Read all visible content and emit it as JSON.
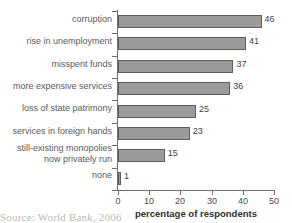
{
  "chart_data": {
    "type": "bar",
    "orientation": "horizontal",
    "title": "",
    "xlabel": "percentage of respondents",
    "ylabel": "",
    "xlim": [
      0,
      50
    ],
    "xticks": [
      0,
      10,
      20,
      30,
      40,
      50
    ],
    "grid": false,
    "legend": null,
    "categories": [
      "corruption",
      "rise in unemployment",
      "misspent funds",
      "more expensive services",
      "loss of state patrimony",
      "services in foreign hands",
      "still-existing monopolies\nnow privately run",
      "none"
    ],
    "values": [
      46,
      41,
      37,
      36,
      25,
      23,
      15,
      1
    ],
    "value_labels": [
      "46",
      "41",
      "37",
      "36",
      "25",
      "23",
      "15",
      "1"
    ],
    "bar_fill_color": "#9a9a9a",
    "bar_border_color": "#5d5d5d",
    "axis_color": "#6f6f6f"
  },
  "footer": {
    "source": "Source: World Bank, 2006"
  }
}
